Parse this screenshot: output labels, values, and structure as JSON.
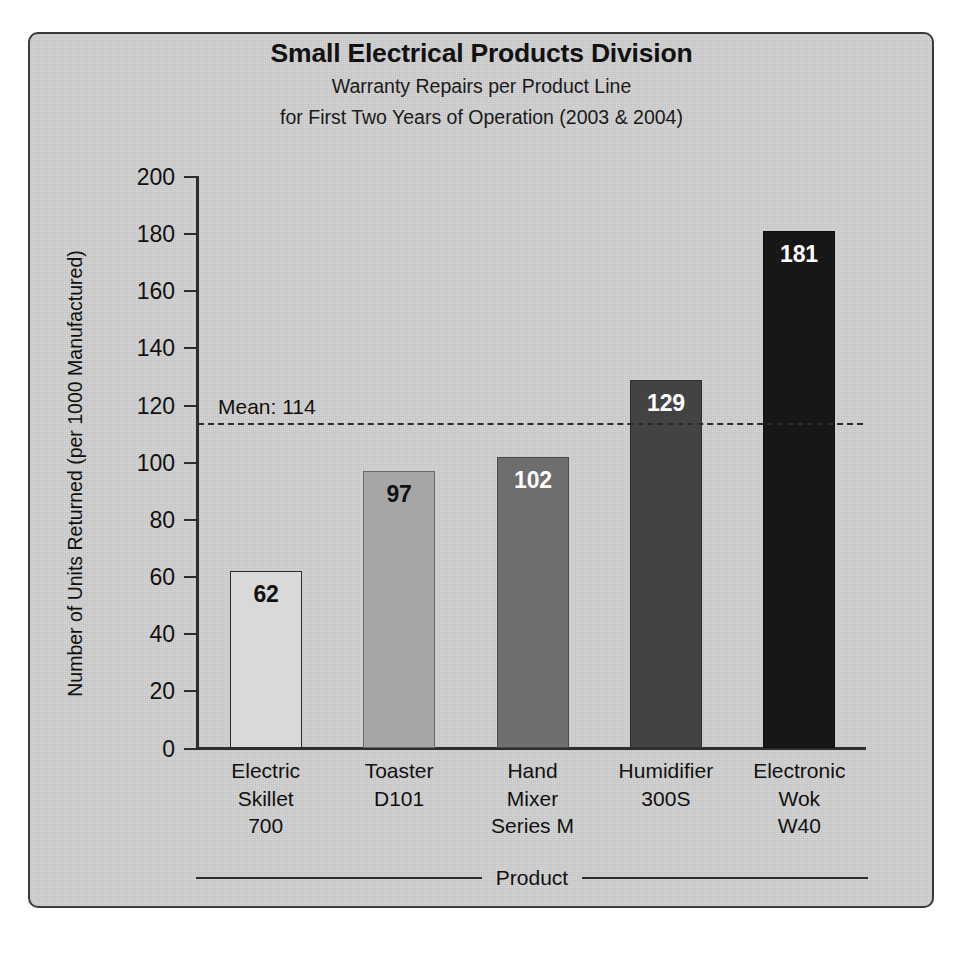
{
  "chart_data": {
    "type": "bar",
    "title": "Small Electrical Products Division",
    "subtitle_line1": "Warranty Repairs per Product Line",
    "subtitle_line2": "for First Two Years of Operation (2003 & 2004)",
    "xlabel": "Product",
    "ylabel": "Number of Units Returned (per 1000 Manufactured)",
    "ylim": [
      0,
      200
    ],
    "ytick_step": 20,
    "yticks": [
      "200",
      "180",
      "160",
      "140",
      "120",
      "100",
      "80",
      "60",
      "40",
      "20",
      "0"
    ],
    "grid": false,
    "legend": "none",
    "categories": [
      "Electric\nSkillet\n700",
      "Toaster\nD101",
      "Hand\nMixer\nSeries M",
      "Humidifier\n300S",
      "Electronic\nWok\nW40"
    ],
    "category_lines": [
      [
        "Electric",
        "Skillet",
        "700"
      ],
      [
        "Toaster",
        "D101"
      ],
      [
        "Hand",
        "Mixer",
        "Series M"
      ],
      [
        "Humidifier",
        "300S"
      ],
      [
        "Electronic",
        "Wok",
        "W40"
      ]
    ],
    "values": [
      62,
      97,
      102,
      129,
      181
    ],
    "value_labels": [
      "62",
      "97",
      "102",
      "129",
      "181"
    ],
    "bar_colors": [
      "#d9d9d9",
      "#a6a6a6",
      "#6e6e6e",
      "#434343",
      "#171717"
    ],
    "bar_label_colors": [
      "#111111",
      "#111111",
      "#ffffff",
      "#ffffff",
      "#ffffff"
    ],
    "bar_border_colors": [
      "#2e2e2e",
      "#6a6a6a",
      "#4a4a4a",
      "#2e2e2e",
      "#101010"
    ],
    "annotations": [
      {
        "name": "mean-line",
        "label": "Mean: 114",
        "value": 114,
        "style": "dashed"
      }
    ]
  },
  "colors": {
    "panel_background": "#d2d2d2",
    "frame_border": "#3a3a3a",
    "axis": "#2e2e2e",
    "text": "#111111"
  }
}
